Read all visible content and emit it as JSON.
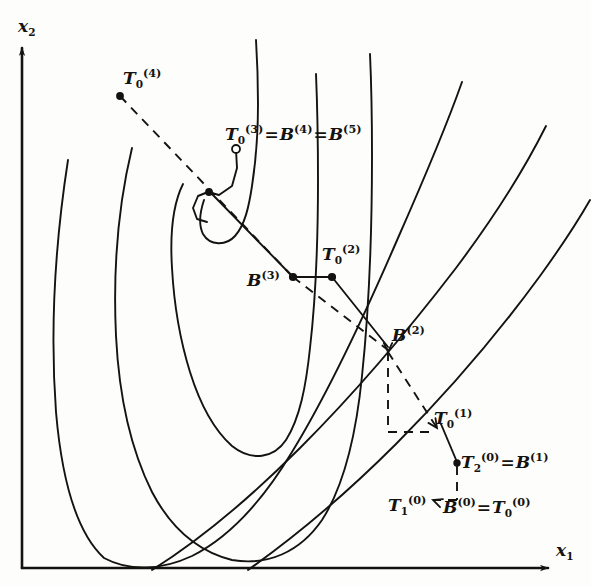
{
  "figure": {
    "kind": "hand-drawn optimization trajectory on contour map",
    "background_color": "#fdfdfb",
    "ink_color": "#15130f"
  },
  "axes": {
    "x_label_base": "x",
    "x_label_sub": "1",
    "y_label_base": "x",
    "y_label_sub": "2",
    "origin": [
      22,
      568
    ],
    "x_axis_end": [
      560,
      568
    ],
    "y_axis_end": [
      22,
      44
    ]
  },
  "labels": [
    {
      "id": "y-axis",
      "name": "y-axis-label",
      "text": "x",
      "sub": "2",
      "sup": "",
      "eq_parts": [],
      "x": 18,
      "y": 18,
      "size": 17
    },
    {
      "id": "x-axis",
      "name": "x-axis-label",
      "text": "x",
      "sub": "1",
      "sup": "",
      "eq_parts": [],
      "x": 556,
      "y": 542,
      "size": 17
    },
    {
      "id": "T0-4",
      "name": "label-T0-4",
      "text": "T",
      "sub": "0",
      "sup": "(4)",
      "eq_parts": [],
      "x": 123,
      "y": 68,
      "size": 17
    },
    {
      "id": "T0-3",
      "name": "label-T0-3",
      "text": "T",
      "sub": "0",
      "sup": "(3)",
      "eq_parts": [
        [
          "B",
          "",
          "(4)"
        ],
        [
          "B",
          "",
          "(5)"
        ]
      ],
      "x": 225,
      "y": 124,
      "size": 17
    },
    {
      "id": "T0-2",
      "name": "label-T0-2",
      "text": "T",
      "sub": "0",
      "sup": "(2)",
      "eq_parts": [],
      "x": 322,
      "y": 244,
      "size": 17
    },
    {
      "id": "B-3",
      "name": "label-B-3",
      "text": "B",
      "sub": "",
      "sup": "(3)",
      "eq_parts": [],
      "x": 247,
      "y": 270,
      "size": 17
    },
    {
      "id": "B-2",
      "name": "label-B-2",
      "text": "B",
      "sub": "",
      "sup": "(2)",
      "eq_parts": [],
      "x": 392,
      "y": 325,
      "size": 17
    },
    {
      "id": "T0-1",
      "name": "label-T0-1",
      "text": "T",
      "sub": "0",
      "sup": "(1)",
      "ex": true,
      "eq_parts": [],
      "x": 434,
      "y": 408,
      "size": 17
    },
    {
      "id": "T2-0",
      "name": "label-T2-0",
      "text": "T",
      "sub": "2",
      "sup": "(0)",
      "eq_parts": [
        [
          "B",
          "",
          "(1)"
        ]
      ],
      "x": 461,
      "y": 452,
      "size": 17
    },
    {
      "id": "T1-0",
      "name": "label-T1-0",
      "text": "T",
      "sub": "1",
      "sup": "(0)",
      "eq_parts": [],
      "x": 388,
      "y": 495,
      "size": 17
    },
    {
      "id": "B-0",
      "name": "label-B-0",
      "text": "B",
      "sub": "",
      "sup": "(0)",
      "eq_parts": [
        [
          "T",
          "0",
          "(0)"
        ]
      ],
      "x": 443,
      "y": 497,
      "size": 17
    }
  ],
  "contours": [
    {
      "name": "contour-1-innermost",
      "d": "M 204 200 C 200 212 198 224 203 234 C 210 246 226 246 235 236 C 245 225 249 206 252 186 C 256 160 258 132 258 104 C 258 78 257 56 256 40"
    },
    {
      "name": "contour-2",
      "d": "M 183 184 C 172 206 170 236 172 268 C 174 304 180 340 190 372 C 200 404 214 430 232 446 C 252 462 274 458 286 440 C 300 418 306 386 310 348 C 316 296 318 236 318 180 C 318 134 317 98 316 74"
    },
    {
      "name": "contour-3",
      "d": "M 132 148 C 118 206 113 272 116 336 C 119 396 131 450 152 492 C 172 530 200 552 232 560 C 268 566 300 552 322 520 C 344 486 356 436 362 376 C 370 300 372 222 372 156 C 372 110 371 76 370 54"
    },
    {
      "name": "contour-4",
      "d": "M 68 160 C 55 244 50 330 56 412 C 62 482 78 534 104 558 C 130 572 162 570 192 556 C 228 538 262 502 292 452 C 330 390 366 312 398 238 C 428 170 450 116 462 82"
    },
    {
      "name": "contour-5-outer-right",
      "d": "M 152 570 C 200 540 250 498 300 448 C 356 392 410 328 456 268 C 498 212 528 162 546 126"
    },
    {
      "name": "contour-6-outermost",
      "d": "M 248 570 C 296 536 346 494 396 444 C 452 388 502 328 540 276 C 566 240 582 214 590 200"
    }
  ],
  "solid_segments": [
    {
      "name": "segment-T03-stem",
      "points": [
        [
          236,
          150
        ],
        [
          237,
          168
        ],
        [
          232,
          186
        ],
        [
          219,
          195
        ],
        [
          208,
          192
        ]
      ]
    },
    {
      "name": "segment-T03-hook",
      "points": [
        [
          208,
          192
        ],
        [
          198,
          196
        ],
        [
          193,
          208
        ],
        [
          197,
          219
        ],
        [
          207,
          222
        ]
      ]
    },
    {
      "name": "segment-B3-path",
      "points": [
        [
          211,
          193
        ],
        [
          293,
          277
        ]
      ]
    },
    {
      "name": "segment-B3-T02",
      "points": [
        [
          293,
          277
        ],
        [
          332,
          277
        ]
      ]
    },
    {
      "name": "segment-T02-B2",
      "points": [
        [
          332,
          277
        ],
        [
          388,
          347
        ]
      ]
    },
    {
      "name": "segment-T01-T20",
      "points": [
        [
          441,
          424
        ],
        [
          457,
          462
        ]
      ]
    }
  ],
  "dashed_segments": [
    {
      "name": "dash-T04-to-B3",
      "points": [
        [
          120,
          96
        ],
        [
          293,
          277
        ]
      ]
    },
    {
      "name": "dash-B3-to-B2",
      "points": [
        [
          293,
          277
        ],
        [
          388,
          350
        ]
      ]
    },
    {
      "name": "dash-B2-down",
      "points": [
        [
          388,
          352
        ],
        [
          388,
          432
        ]
      ]
    },
    {
      "name": "dash-B2-bottom",
      "points": [
        [
          388,
          432
        ],
        [
          436,
          432
        ]
      ]
    },
    {
      "name": "dash-B2-diag",
      "points": [
        [
          388,
          352
        ],
        [
          437,
          428
        ]
      ]
    },
    {
      "name": "dash-T20-down",
      "points": [
        [
          457,
          466
        ],
        [
          457,
          500
        ]
      ]
    },
    {
      "name": "dash-T20-left",
      "points": [
        [
          457,
          500
        ],
        [
          433,
          500
        ]
      ]
    }
  ],
  "markers": [
    {
      "name": "marker-T0-4",
      "x": 120,
      "y": 96,
      "r": 3.0,
      "filled": true
    },
    {
      "name": "marker-T0-3",
      "x": 236,
      "y": 149,
      "r": 4.0,
      "filled": false
    },
    {
      "name": "marker-inner-dot",
      "x": 209,
      "y": 192,
      "r": 3.0,
      "filled": true
    },
    {
      "name": "marker-B-3",
      "x": 293,
      "y": 277,
      "r": 3.2,
      "filled": true
    },
    {
      "name": "marker-T0-2",
      "x": 332,
      "y": 277,
      "r": 3.2,
      "filled": true
    },
    {
      "name": "marker-T2-0",
      "x": 457,
      "y": 463,
      "r": 2.8,
      "filled": true
    }
  ],
  "arrowheads": [
    {
      "name": "arrowhead-to-T01",
      "x": 437,
      "y": 428,
      "angle": 56
    },
    {
      "name": "arrowhead-to-B2",
      "x": 388,
      "y": 352,
      "angle": 90
    },
    {
      "name": "arrowhead-T1-0",
      "x": 433,
      "y": 500,
      "angle": 200
    }
  ]
}
